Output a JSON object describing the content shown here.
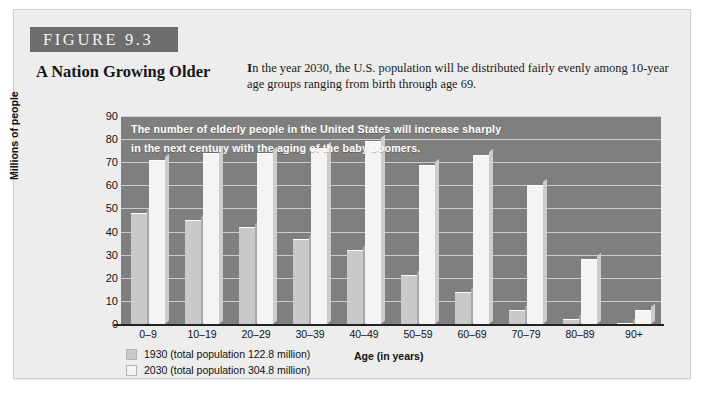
{
  "figure": {
    "banner_label": "FIGURE 9.3",
    "title": "A Nation Growing Older",
    "caption_lead": "I",
    "caption": "n the year 2030, the U.S. population will be distributed fairly evenly among 10-year age groups ranging from birth through age 69."
  },
  "chart_data": {
    "type": "bar",
    "title": "A Nation Growing Older",
    "annotation": "The number of elderly people in the United States will increase sharply in the next century with the aging of the baby boomers.",
    "annotation_line1": "The number of elderly people in the United States will increase sharply",
    "annotation_line2": "in the next century with the aging of the baby boomers.",
    "categories": [
      "0–9",
      "10–19",
      "20–29",
      "30–39",
      "40–49",
      "50–59",
      "60–69",
      "70–79",
      "80–89",
      "90+"
    ],
    "series": [
      {
        "name": "1930 (total population 122.8 million)",
        "year": "1930",
        "total_population": "122.8 million",
        "color": "#c9c9c9",
        "values": [
          48,
          45,
          42,
          37,
          32,
          21,
          14,
          6,
          2,
          0.4
        ]
      },
      {
        "name": "2030 (total population 304.8 million)",
        "year": "2030",
        "total_population": "304.8 million",
        "color": "#f4f4f4",
        "values": [
          71,
          74,
          74,
          76,
          79,
          69,
          73,
          60,
          28,
          6
        ]
      }
    ],
    "xlabel": "Age (in years)",
    "ylabel": "Millions of people",
    "ylim": [
      0,
      90
    ],
    "yticks": [
      0,
      10,
      20,
      30,
      40,
      50,
      60,
      70,
      80,
      90
    ],
    "grid": true,
    "legend_position": "bottom-left",
    "plot_background": "#7f7f7f"
  }
}
